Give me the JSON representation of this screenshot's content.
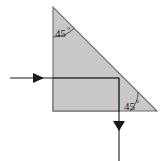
{
  "figure": {
    "background_color": "#ffffff",
    "fill_color": "#c8c8c8",
    "stroke_color": "#555555",
    "arrow_color": "#1a1a1a",
    "shapes": {
      "triangle": {
        "name": "right-triangle",
        "points": "53,7 53,111 157,111",
        "fill": "#c8c8c8",
        "stroke": "#6b6b6b"
      },
      "rectangle": {
        "name": "inscribed-rectangle",
        "x": 53,
        "y": 78,
        "width": 66,
        "height": 33,
        "fill": "#c8c8c8",
        "stroke": "#6b6b6b"
      }
    },
    "angles": [
      {
        "id": "top-angle",
        "value": "45",
        "degree_symbol": "°",
        "vertex": "53,7",
        "label_x": 55,
        "label_y": 37,
        "arc_path": "M 53 37 A 30 30 0 0 0 74.2 28.2"
      },
      {
        "id": "bottom-right-angle",
        "value": "45",
        "degree_symbol": "°",
        "vertex": "157,111",
        "label_x": 124,
        "label_y": 110,
        "arc_path": "M 130 111 A 27 27 0 0 0 138.1 91.9"
      }
    ],
    "arrows": [
      {
        "id": "inlet-arrow",
        "direction": "right",
        "line": {
          "x1": 10,
          "y1": 78,
          "x2": 119,
          "y2": 78
        },
        "head": "33,73 44,78 33,83",
        "color": "#1a1a1a"
      },
      {
        "id": "outlet-arrow",
        "direction": "down",
        "line": {
          "x1": 119,
          "y1": 78,
          "x2": 119,
          "y2": 161
        },
        "head": "113,121 125,121 119,131",
        "color": "#1a1a1a"
      }
    ]
  }
}
